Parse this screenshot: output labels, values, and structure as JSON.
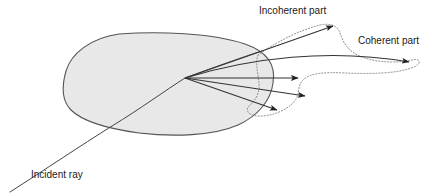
{
  "figure": {
    "background_color": "#ffffff"
  },
  "labels": {
    "incident_ray": "Incident ray",
    "incoherent_part": "Incoherent part",
    "coherent_part": "Coherent part"
  },
  "colors": {
    "blob_fill": "#e8e8e8",
    "blob_stroke": "#555555",
    "ray_stroke": "#333333",
    "envelope_stroke": "#777777",
    "text": "#1a1a1a"
  },
  "geometry": {
    "scatter_point": {
      "x": 185,
      "y": 78
    },
    "incident_ray_entry": {
      "x": 10,
      "y": 192
    },
    "medium_bounds": {
      "left": 65,
      "top": 33,
      "right": 274,
      "bottom": 134
    },
    "label_positions": {
      "incident_ray": {
        "x": 31,
        "y": 175
      },
      "incoherent_part": {
        "x": 259,
        "y": 14
      },
      "coherent_part": {
        "x": 358,
        "y": 44
      }
    }
  },
  "elements": {
    "medium_blob": "scattering-medium",
    "incident_ray": "incident-ray-curve",
    "scattered_rays_count": 5,
    "envelope": "scattering-lobe-envelope"
  }
}
